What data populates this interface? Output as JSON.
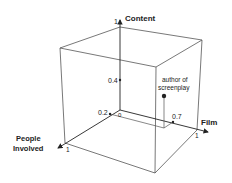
{
  "diagram": {
    "type": "3d-cube-axes",
    "axes": {
      "content": {
        "label": "Content",
        "max_tick": "1"
      },
      "film": {
        "label": "Film",
        "max_tick": "1"
      },
      "people": {
        "label_line1": "People",
        "label_line2": "Involved",
        "max_tick": "1"
      }
    },
    "origin_label": "0",
    "ticks": {
      "content_value": "0.4",
      "people_value": "0.2",
      "film_value": "0.7"
    },
    "point": {
      "label_line1": "author of",
      "label_line2": "screenplay",
      "coords": {
        "people": 0.2,
        "film": 0.7,
        "content": 0.4
      }
    },
    "colors": {
      "lines": "#444444",
      "text": "#222222",
      "background": "#ffffff"
    }
  }
}
